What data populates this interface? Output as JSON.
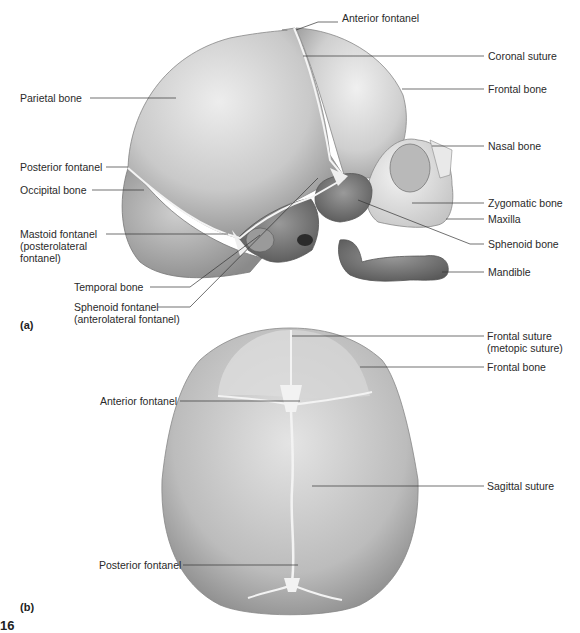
{
  "figure": {
    "panel_a": {
      "tag": "(a)",
      "view": "lateral view of fetal skull",
      "labels": [
        {
          "id": "anterior-fontanel",
          "text": "Anterior fontanel",
          "x": 342,
          "y": 18
        },
        {
          "id": "coronal-suture",
          "text": "Coronal suture",
          "x": 488,
          "y": 51
        },
        {
          "id": "frontal-bone",
          "text": "Frontal bone",
          "x": 488,
          "y": 84
        },
        {
          "id": "nasal-bone",
          "text": "Nasal bone",
          "x": 488,
          "y": 141
        },
        {
          "id": "parietal-bone",
          "text": "Parietal bone",
          "x": 20,
          "y": 93
        },
        {
          "id": "posterior-fontanel",
          "text": "Posterior fontanel",
          "x": 20,
          "y": 162
        },
        {
          "id": "occipital-bone",
          "text": "Occipital bone",
          "x": 20,
          "y": 185
        },
        {
          "id": "zygomatic-bone",
          "text": "Zygomatic bone",
          "x": 488,
          "y": 198
        },
        {
          "id": "maxilla",
          "text": "Maxilla",
          "x": 488,
          "y": 214
        },
        {
          "id": "mastoid-fontanel",
          "text": "Mastoid fontanel\n(posterolateral\nfontanel)",
          "x": 20,
          "y": 228
        },
        {
          "id": "sphenoid-bone",
          "text": "Sphenoid bone",
          "x": 488,
          "y": 239
        },
        {
          "id": "mandible",
          "text": "Mandible",
          "x": 488,
          "y": 267
        },
        {
          "id": "temporal-bone",
          "text": "Temporal bone",
          "x": 74,
          "y": 282
        },
        {
          "id": "sphenoid-fontanel",
          "text": "Sphenoid fontanel\n(anterolateral fontanel)",
          "x": 74,
          "y": 302
        }
      ]
    },
    "panel_b": {
      "tag": "(b)",
      "view": "superior view of fetal skull",
      "labels": [
        {
          "id": "frontal-suture",
          "text": "Frontal suture\n(metopic suture)",
          "x": 487,
          "y": 330
        },
        {
          "id": "frontal-bone-b",
          "text": "Frontal bone",
          "x": 487,
          "y": 362
        },
        {
          "id": "anterior-fontanel-b",
          "text": "Anterior fontanel",
          "x": 100,
          "y": 396
        },
        {
          "id": "sagittal-suture",
          "text": "Sagittal suture",
          "x": 487,
          "y": 481
        },
        {
          "id": "posterior-fontanel-b",
          "text": "Posterior fontanel",
          "x": 99,
          "y": 560
        }
      ]
    },
    "figure_number": "16",
    "colors": {
      "bone_light": "#e6e6e6",
      "bone_mid": "#bdbdbd",
      "bone_dark": "#6f6f6f",
      "suture": "#f4f4f4",
      "leader": "#333333"
    }
  }
}
